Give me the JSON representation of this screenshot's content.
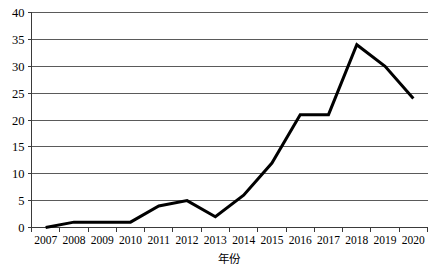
{
  "chart_data": {
    "type": "line",
    "title": "",
    "subtitle": "",
    "xlabel": "年份",
    "ylabel": "",
    "categories": [
      "2007",
      "2008",
      "2009",
      "2010",
      "2011",
      "2012",
      "2013",
      "2014",
      "2015",
      "2016",
      "2017",
      "2018",
      "2019",
      "2020"
    ],
    "x": [
      2007,
      2008,
      2009,
      2010,
      2011,
      2012,
      2013,
      2014,
      2015,
      2016,
      2017,
      2018,
      2019,
      2020
    ],
    "values": [
      0,
      1,
      1,
      1,
      4,
      5,
      2,
      6,
      12,
      21,
      21,
      34,
      30,
      24
    ],
    "series": [
      {
        "name": "",
        "values": [
          0,
          1,
          1,
          1,
          4,
          5,
          2,
          6,
          12,
          21,
          21,
          34,
          30,
          24
        ]
      }
    ],
    "ylim": [
      0,
      40
    ],
    "yticks": [
      0,
      5,
      10,
      15,
      20,
      25,
      30,
      35,
      40
    ],
    "ytick_labels": [
      "0",
      "5",
      "10",
      "15",
      "20",
      "25",
      "30",
      "35",
      "40"
    ],
    "xtick_labels": [
      "2007",
      "2008",
      "2009",
      "2010",
      "2011",
      "2012",
      "2013",
      "2014",
      "2015",
      "2016",
      "2017",
      "2018",
      "2019",
      "2020"
    ],
    "grid": "horizontal",
    "legend": "none",
    "line_color": "#000000",
    "grid_color": "#5a5a5a",
    "axis_color": "#3a3a3a",
    "background_color": "#ffffff",
    "markers": "none",
    "annotations": []
  }
}
